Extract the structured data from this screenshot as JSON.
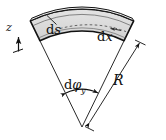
{
  "figure": {
    "background_color": "#ffffff",
    "stroke_color": "#111111",
    "fill_color": "#d8d8d8",
    "fill_color_light": "#e6e6e6",
    "dash_color": "#555555"
  },
  "labels": {
    "arc_length": {
      "d": "d",
      "sym": "s"
    },
    "axial_length": {
      "d": "d",
      "sym": "x"
    },
    "angle": {
      "d": "d",
      "sym": "φ",
      "subscript": "y"
    },
    "radius": {
      "sym": "R"
    },
    "axis_z": {
      "sym": "z"
    }
  },
  "geometry": {
    "apex_x": 82,
    "apex_y": 127,
    "outer_radius": 118,
    "inner_radius": 96,
    "mid_radius": 107,
    "half_angle_deg": 26
  },
  "annotations": [
    {
      "name": "ds-leader",
      "description": "leader line from ds label to outer arc"
    },
    {
      "name": "dx-dashed-arc",
      "description": "dashed mid-surface arc with left arrowhead"
    },
    {
      "name": "dphi-angle-arc",
      "description": "double headed arc spanning the opening angle at apex"
    },
    {
      "name": "R-dimension-line",
      "description": "dimension line from apex to outer arc with arrowheads at both ends"
    },
    {
      "name": "z-axis-arrow",
      "description": "short vertical arrow pointing up labelled z"
    }
  ]
}
